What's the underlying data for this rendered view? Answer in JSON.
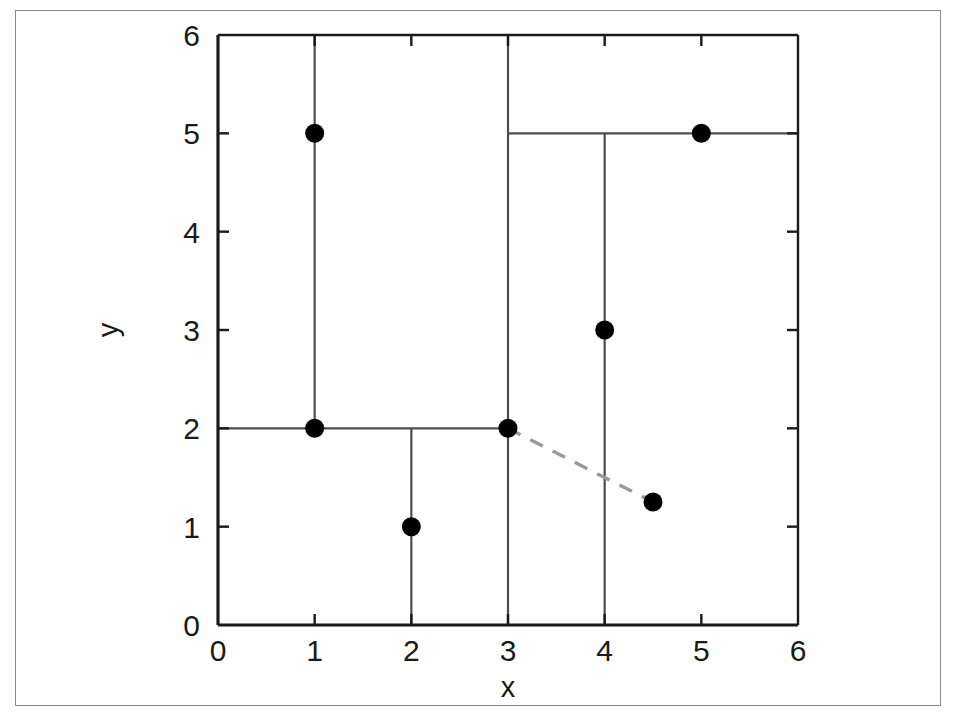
{
  "figure": {
    "background_color": "#ffffff",
    "frame_color": "#8a8a8a",
    "axis_color": "#1a1a1a",
    "partition_color": "#4d4d4d",
    "point_color": "#000000",
    "query_line_color": "#999999"
  },
  "chart_data": {
    "type": "scatter",
    "title": "",
    "subtitle": "",
    "xlabel": "x",
    "ylabel": "y",
    "xlim": [
      0,
      6
    ],
    "ylim": [
      0,
      6
    ],
    "xticks": [
      "0",
      "1",
      "2",
      "3",
      "4",
      "5",
      "6"
    ],
    "yticks": [
      "0",
      "1",
      "2",
      "3",
      "4",
      "5",
      "6"
    ],
    "xtick_values": [
      0,
      1,
      2,
      3,
      4,
      5,
      6
    ],
    "ytick_values": [
      0,
      1,
      2,
      3,
      4,
      5,
      6
    ],
    "grid": false,
    "legend": null,
    "series": [
      {
        "name": "data points",
        "marker": "filled-circle",
        "color": "#000000",
        "points": [
          {
            "x": 1,
            "y": 5,
            "label": "p-1-5"
          },
          {
            "x": 1,
            "y": 2,
            "label": "p-1-2"
          },
          {
            "x": 2,
            "y": 1,
            "label": "p-2-1"
          },
          {
            "x": 3,
            "y": 2,
            "label": "p-3-2"
          },
          {
            "x": 4,
            "y": 3,
            "label": "p-4-3"
          },
          {
            "x": 5,
            "y": 5,
            "label": "p-5-5"
          }
        ]
      },
      {
        "name": "query point",
        "marker": "filled-circle",
        "color": "#000000",
        "points": [
          {
            "x": 4.5,
            "y": 1.25,
            "label": "q"
          }
        ]
      }
    ],
    "partitions": [
      {
        "orientation": "vertical",
        "at": 1,
        "from": 2,
        "to": 6,
        "label": "split-x-1"
      },
      {
        "orientation": "vertical",
        "at": 3,
        "from": 0,
        "to": 6,
        "label": "split-x-3"
      },
      {
        "orientation": "vertical",
        "at": 2,
        "from": 0,
        "to": 2,
        "label": "split-x-2"
      },
      {
        "orientation": "vertical",
        "at": 4,
        "from": 0,
        "to": 5,
        "label": "split-x-4"
      },
      {
        "orientation": "horizontal",
        "at": 2,
        "from": 0,
        "to": 3,
        "label": "split-y-2"
      },
      {
        "orientation": "horizontal",
        "at": 5,
        "from": 3,
        "to": 6,
        "label": "split-y-5"
      }
    ],
    "annotations": [
      {
        "type": "dashed-connector",
        "from": {
          "x": 3,
          "y": 2
        },
        "to": {
          "x": 4.5,
          "y": 1.25
        },
        "color": "#999999",
        "label": "nearest-neighbor-connector"
      }
    ]
  }
}
